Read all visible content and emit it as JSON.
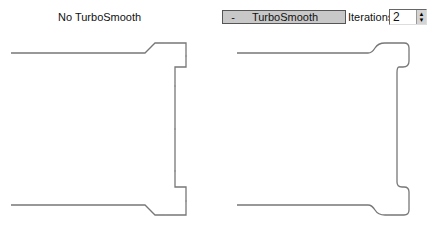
{
  "left_panel": {
    "label": "No TurboSmooth"
  },
  "right_panel": {
    "rollout": {
      "toggle": "-",
      "title": "TurboSmooth"
    },
    "iterations": {
      "label": "Iterations:",
      "value": "2",
      "up": "▲",
      "down": "▼"
    }
  },
  "colors": {
    "line": "#777777",
    "vertex": "#999999"
  }
}
